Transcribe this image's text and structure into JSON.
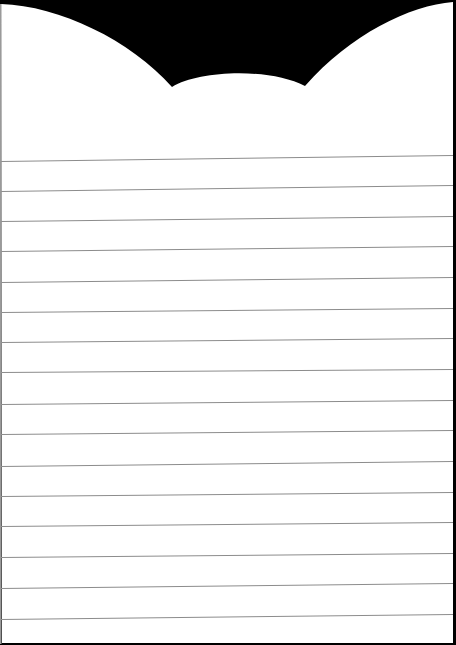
{
  "page": {
    "type": "lined-notepad-sheet",
    "background_color": "#000000",
    "paper_color": "#ffffff",
    "line_color": "#8c8c8c",
    "line_count": 16
  },
  "header_shape": {
    "description": "scalloped top edge with two large arcs and a small center bump",
    "left_arc_points": [
      [
        2,
        3
      ],
      [
        60,
        13
      ],
      [
        100,
        30
      ],
      [
        130,
        50
      ],
      [
        160,
        77
      ],
      [
        172,
        87
      ]
    ],
    "center_bump": {
      "left_cusp": [
        172,
        87
      ],
      "peak": [
        236,
        72
      ],
      "right_cusp": [
        305,
        86
      ]
    },
    "right_arc_points": [
      [
        305,
        86
      ],
      [
        330,
        60
      ],
      [
        360,
        37
      ],
      [
        400,
        17
      ],
      [
        440,
        5
      ],
      [
        456,
        3
      ]
    ]
  },
  "ruled_lines": [
    {
      "index": 1,
      "y_left": 161,
      "y_right": 155
    },
    {
      "index": 2,
      "y_left": 191,
      "y_right": 185
    },
    {
      "index": 3,
      "y_left": 221,
      "y_right": 216
    },
    {
      "index": 4,
      "y_left": 251,
      "y_right": 246
    },
    {
      "index": 5,
      "y_left": 282,
      "y_right": 277
    },
    {
      "index": 6,
      "y_left": 312,
      "y_right": 308
    },
    {
      "index": 7,
      "y_left": 342,
      "y_right": 338
    },
    {
      "index": 8,
      "y_left": 372,
      "y_right": 369
    },
    {
      "index": 9,
      "y_left": 404,
      "y_right": 400
    },
    {
      "index": 10,
      "y_left": 434,
      "y_right": 430
    },
    {
      "index": 11,
      "y_left": 466,
      "y_right": 461
    },
    {
      "index": 12,
      "y_left": 496,
      "y_right": 492
    },
    {
      "index": 13,
      "y_left": 526,
      "y_right": 522
    },
    {
      "index": 14,
      "y_left": 557,
      "y_right": 553
    },
    {
      "index": 15,
      "y_left": 588,
      "y_right": 583
    },
    {
      "index": 16,
      "y_left": 619,
      "y_right": 614
    }
  ]
}
